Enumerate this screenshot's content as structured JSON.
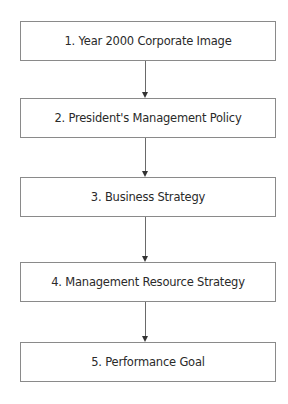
{
  "diagram": {
    "type": "vertical-flowchart",
    "steps": [
      {
        "label": "1. Year 2000 Corporate Image"
      },
      {
        "label": "2. President's Management Policy"
      },
      {
        "label": "3. Business Strategy"
      },
      {
        "label": "4. Management Resource Strategy"
      },
      {
        "label": "5. Performance Goal"
      }
    ],
    "connectors": [
      {
        "from": 1,
        "to": 2,
        "style": "arrow-down"
      },
      {
        "from": 2,
        "to": 3,
        "style": "arrow-down"
      },
      {
        "from": 3,
        "to": 4,
        "style": "arrow-down"
      },
      {
        "from": 4,
        "to": 5,
        "style": "arrow-down"
      }
    ],
    "colors": {
      "box_border": "#8a8a8a",
      "text": "#2a2a2a",
      "arrow": "#6a6a6a",
      "background": "#ffffff"
    }
  }
}
